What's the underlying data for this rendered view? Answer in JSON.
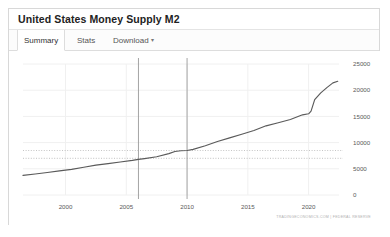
{
  "card": {
    "title": "United States Money Supply M2"
  },
  "tabs": [
    {
      "id": "summary",
      "label": "Summary",
      "active": true
    },
    {
      "id": "stats",
      "label": "Stats",
      "active": false
    },
    {
      "id": "download",
      "label": "Download",
      "active": false,
      "caret": "▾"
    }
  ],
  "attribution": "TRADINGECONOMICS.COM | FEDERAL RESERVE",
  "colors": {
    "line": "#5a5a5a",
    "grid": "#f0f0f0",
    "marker_line": "#9a9a9a",
    "dotted": "#9a9a9a",
    "text": "#5a5a5a",
    "card_border": "#d8d8d8"
  },
  "chart_data": {
    "type": "line",
    "title": "United States Money Supply M2",
    "xlabel": "",
    "ylabel": "",
    "xlim": [
      1996.5,
      2022.5
    ],
    "ylim": [
      0,
      25000
    ],
    "grid": true,
    "legend": false,
    "xticks": [
      "2000",
      "2005",
      "2010",
      "2015",
      "2020"
    ],
    "xtick_values": [
      2000,
      2005,
      2010,
      2015,
      2020
    ],
    "yticks": [
      "0",
      "5000",
      "10000",
      "15000",
      "20000",
      "25000"
    ],
    "ytick_values": [
      0,
      5000,
      10000,
      15000,
      20000,
      25000
    ],
    "series": [
      {
        "name": "M2 Money Supply (USD Billion)",
        "x": [
          1996.5,
          1997.5,
          1998.5,
          1999.5,
          2000.5,
          2001.5,
          2002.5,
          2003.5,
          2004.5,
          2005.5,
          2006.0,
          2006.5,
          2007.5,
          2008.5,
          2009.0,
          2009.5,
          2010.0,
          2010.5,
          2011.5,
          2012.5,
          2013.5,
          2014.5,
          2015.5,
          2016.5,
          2017.5,
          2018.5,
          2019.5,
          2020.0,
          2020.2,
          2020.5,
          2021.0,
          2021.5,
          2022.0,
          2022.4
        ],
        "y": [
          3750,
          4000,
          4300,
          4600,
          4900,
          5300,
          5700,
          6000,
          6300,
          6600,
          6800,
          6950,
          7300,
          7900,
          8300,
          8450,
          8500,
          8700,
          9400,
          10200,
          10900,
          11600,
          12300,
          13200,
          13800,
          14400,
          15300,
          15500,
          16000,
          18200,
          19500,
          20500,
          21400,
          21700
        ],
        "units": "USD Billion"
      }
    ],
    "annotations": {
      "vertical_lines": [
        {
          "x": 2006.0,
          "label": ""
        },
        {
          "x": 2010.0,
          "label": ""
        }
      ],
      "horizontal_dotted_lines": [
        {
          "y": 8500,
          "label": ""
        },
        {
          "y": 7000,
          "label": ""
        }
      ]
    }
  }
}
